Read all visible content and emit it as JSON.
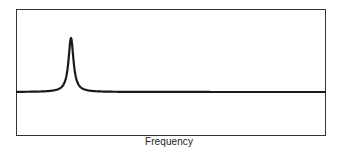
{
  "chart_data": {
    "type": "line",
    "title": "",
    "xlabel": "Frequency",
    "ylabel": "",
    "grid": false,
    "legend": null,
    "frame": {
      "left": 16,
      "top": 9,
      "right": 326,
      "bottom": 136
    },
    "baseline_y_px": 92,
    "peak": {
      "x_px": 71,
      "y_px": 38,
      "half_width_px": 3
    },
    "series": [
      {
        "name": "spectrum",
        "color": "#1a1a1a",
        "points_px": [
          [
            16,
            92
          ],
          [
            50,
            92
          ],
          [
            58,
            91.5
          ],
          [
            63,
            90
          ],
          [
            66,
            87
          ],
          [
            68,
            80
          ],
          [
            69.5,
            65
          ],
          [
            70.5,
            45
          ],
          [
            71,
            38
          ],
          [
            71.5,
            45
          ],
          [
            72.5,
            65
          ],
          [
            74,
            80
          ],
          [
            76,
            87
          ],
          [
            79,
            90
          ],
          [
            84,
            91.5
          ],
          [
            95,
            92
          ],
          [
            326,
            92
          ]
        ]
      }
    ]
  }
}
